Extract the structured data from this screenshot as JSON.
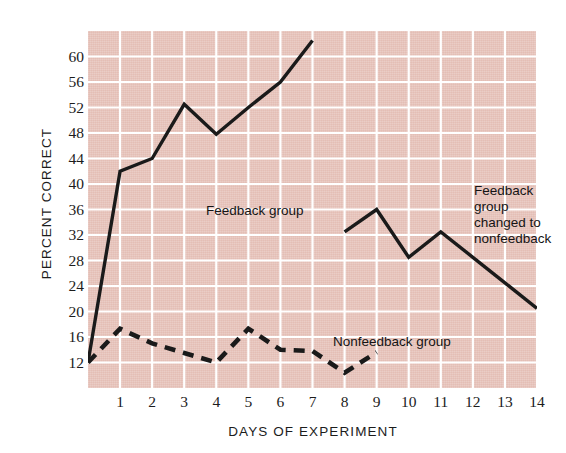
{
  "chart_data": {
    "type": "line",
    "title": "",
    "xlabel": "DAYS OF EXPERIMENT",
    "ylabel": "PERCENT CORRECT",
    "xlim": [
      0,
      14
    ],
    "ylim": [
      8,
      64
    ],
    "grid": true,
    "legend_position": "inline-annotations",
    "x_ticks": [
      1,
      2,
      3,
      4,
      5,
      6,
      7,
      8,
      9,
      10,
      11,
      12,
      13,
      14
    ],
    "y_ticks": [
      12,
      16,
      20,
      24,
      28,
      32,
      36,
      40,
      44,
      48,
      52,
      56,
      60
    ],
    "series": [
      {
        "name": "Feedback group",
        "style": "solid",
        "x": [
          0,
          1,
          2,
          3,
          4,
          5,
          6,
          7
        ],
        "values": [
          12,
          42,
          44,
          52.5,
          47.8,
          52,
          56,
          62.5
        ]
      },
      {
        "name": "Feedback group changed to nonfeedback",
        "style": "solid",
        "x": [
          8,
          9,
          10,
          11,
          12,
          13,
          14
        ],
        "values": [
          32.5,
          36,
          28.5,
          32.5,
          28.5,
          24.5,
          20.5
        ]
      },
      {
        "name": "Nonfeedback group",
        "style": "dashed",
        "x": [
          0,
          1,
          2,
          3,
          4,
          5,
          6,
          7,
          8,
          9
        ],
        "values": [
          12,
          17.3,
          15,
          13.5,
          12,
          17.3,
          14,
          13.8,
          10.4,
          13.6
        ]
      }
    ],
    "annotations": [
      {
        "id": "feedback",
        "text": "Feedback group"
      },
      {
        "id": "nonfeedback",
        "text": "Nonfeedback group"
      },
      {
        "id": "changed",
        "text": "Feedback group\nchanged to\nnonfeedback"
      }
    ],
    "colors": {
      "plot_background": "#e4beb5",
      "gridline": "#ffffff",
      "line": "#1a1a1a",
      "text": "#1c1c1c",
      "page_background": "#ffffff"
    }
  }
}
